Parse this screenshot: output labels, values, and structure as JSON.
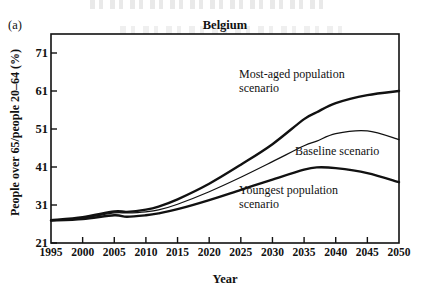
{
  "figure": {
    "panel_label": "(a)",
    "title": "Belgium"
  },
  "axes": {
    "xlabel": "Year",
    "ylabel": "People over 65/people 20–64 (%)"
  },
  "annotations": {
    "most_aged": "Most-aged population\nscenario",
    "baseline": "Baseline scenario",
    "youngest": "Youngest population\nscenario"
  },
  "colors": {
    "ink": "#111111",
    "background": "#ffffff"
  },
  "chart_data": {
    "type": "line",
    "title": "Belgium",
    "xlabel": "Year",
    "ylabel": "People over 65/people 20–64 (%)",
    "xlim": [
      1995,
      2050
    ],
    "ylim": [
      21,
      76
    ],
    "xticks": [
      1995,
      2000,
      2005,
      2010,
      2015,
      2020,
      2025,
      2030,
      2035,
      2040,
      2045,
      2050
    ],
    "yticks": [
      21,
      31,
      41,
      51,
      61,
      71
    ],
    "grid": false,
    "legend": "inline-annotations",
    "x": [
      1995,
      2000,
      2005,
      2007,
      2010,
      2012,
      2015,
      2020,
      2025,
      2030,
      2035,
      2037,
      2040,
      2045,
      2050
    ],
    "series": [
      {
        "name": "Most-aged population scenario",
        "style": "thick",
        "values": [
          27.0,
          27.8,
          29.3,
          29.2,
          29.8,
          30.6,
          32.5,
          36.6,
          41.6,
          47.0,
          53.6,
          55.4,
          57.8,
          59.9,
          61.0
        ]
      },
      {
        "name": "Baseline scenario",
        "style": "thin",
        "values": [
          27.0,
          27.6,
          28.9,
          28.9,
          29.2,
          29.7,
          31.2,
          34.5,
          38.3,
          42.4,
          46.6,
          47.8,
          49.8,
          50.5,
          48.2
        ]
      },
      {
        "name": "Youngest population scenario",
        "style": "thick",
        "values": [
          26.9,
          27.3,
          28.3,
          27.9,
          28.3,
          28.8,
          29.9,
          32.3,
          35.0,
          37.7,
          40.3,
          40.9,
          40.7,
          39.4,
          37.0
        ]
      }
    ]
  }
}
